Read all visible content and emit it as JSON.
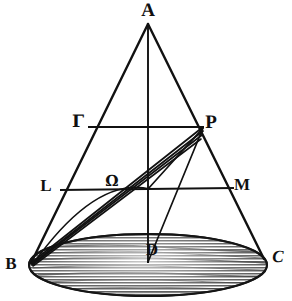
{
  "figure": {
    "ink_color": "#111111",
    "base_fill_color": "#6b6b6b",
    "background_color": "#ffffff"
  },
  "points": [
    {
      "id": "A",
      "label": "A",
      "x": 148,
      "y": 10,
      "style": "lbl-big",
      "role": "apex"
    },
    {
      "id": "Gamma",
      "label": "Γ",
      "x": 78,
      "y": 122,
      "style": "lbl-med lbl-greek",
      "role": "chord-end-left-upper"
    },
    {
      "id": "P",
      "label": "P",
      "x": 211,
      "y": 122,
      "style": "lbl-big",
      "role": "chord-end-right-upper"
    },
    {
      "id": "L",
      "label": "L",
      "x": 46,
      "y": 185,
      "style": "lbl-med",
      "role": "chord-end-left-lower"
    },
    {
      "id": "Omega",
      "label": "Ω",
      "x": 112,
      "y": 181,
      "style": "lbl-small lbl-greek",
      "role": "interior-point"
    },
    {
      "id": "M",
      "label": "M",
      "x": 242,
      "y": 184,
      "style": "lbl-med",
      "role": "chord-end-right-lower"
    },
    {
      "id": "B",
      "label": "B",
      "x": 11,
      "y": 263,
      "style": "lbl-med",
      "role": "base-left"
    },
    {
      "id": "D",
      "label": "D",
      "x": 152,
      "y": 249,
      "style": "lbl-med",
      "role": "base-center"
    },
    {
      "id": "C",
      "label": "C",
      "x": 278,
      "y": 256,
      "style": "lbl-med lbl-slant",
      "role": "base-right"
    }
  ],
  "geometry": {
    "apex": {
      "x": 148,
      "y": 24
    },
    "base_left": {
      "x": 31,
      "y": 263
    },
    "base_right": {
      "x": 264,
      "y": 259
    },
    "base_center": {
      "x": 148,
      "y": 262
    },
    "ellipse": {
      "cx": 148,
      "cy": 265,
      "rx": 119,
      "ry": 31,
      "hatch_line_count": 16
    },
    "chord_upper": {
      "y": 126,
      "x1": 88,
      "x2": 203,
      "left_id": "Gamma",
      "right_id": "P"
    },
    "chord_lower": {
      "y": 189,
      "x1": 60,
      "x2": 233,
      "left_id": "L",
      "right_id": "M"
    },
    "axis": {
      "x1": 148,
      "y1": 24,
      "x2": 148,
      "y2": 263
    },
    "fan_from_B_to_P": [
      {
        "from": {
          "x": 31,
          "y": 263
        },
        "to": {
          "x": 203,
          "y": 127
        }
      },
      {
        "from": {
          "x": 31,
          "y": 263
        },
        "to": {
          "x": 203,
          "y": 130
        }
      },
      {
        "from": {
          "x": 31,
          "y": 263
        },
        "to": {
          "x": 202,
          "y": 133
        }
      },
      {
        "from": {
          "x": 31,
          "y": 263
        },
        "to": {
          "x": 201,
          "y": 136
        }
      }
    ],
    "triangle_P_edges": [
      {
        "from": {
          "x": 203,
          "y": 127
        },
        "to": {
          "x": 148,
          "y": 189
        }
      },
      {
        "from": {
          "x": 203,
          "y": 127
        },
        "to": {
          "x": 148,
          "y": 263
        }
      }
    ]
  }
}
